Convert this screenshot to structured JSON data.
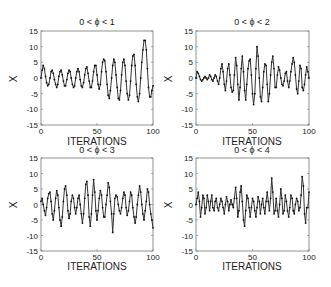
{
  "figure": {
    "panels": [
      {
        "title": "0 < ϕ < 1",
        "xlabel": "ITERATIONS",
        "ylabel": "X"
      },
      {
        "title": "0 < ϕ < 2",
        "xlabel": "ITERATIONS",
        "ylabel": "X"
      },
      {
        "title": "0 < ϕ < 3",
        "xlabel": "ITERATIONS",
        "ylabel": "X"
      },
      {
        "title": "0 < ϕ < 4",
        "xlabel": "ITERATIONS",
        "ylabel": "X"
      }
    ],
    "xticks": [
      "0",
      "50",
      "100"
    ],
    "yticks": [
      "15",
      "10",
      "5",
      "0",
      "-5",
      "-10",
      "-15"
    ],
    "line_color": "#333333"
  },
  "chart_data": [
    {
      "type": "line",
      "title": "0 < ϕ < 1",
      "xlabel": "ITERATIONS",
      "ylabel": "X",
      "xlim": [
        0,
        100
      ],
      "ylim": [
        -15,
        15
      ],
      "grid": false,
      "x_step": 1,
      "values": [
        0,
        2.5,
        4,
        3,
        0.5,
        -1.5,
        -2.5,
        -2,
        0,
        2,
        2.5,
        1.5,
        -0.5,
        -2,
        -3,
        -2,
        0.5,
        2,
        2.5,
        1,
        -1,
        -2.5,
        -2.5,
        -0.5,
        1.5,
        2.5,
        2,
        0,
        -2,
        -3,
        -2.5,
        0,
        2,
        3,
        2,
        -0.5,
        -2.5,
        -3,
        -1.5,
        1,
        3,
        3.5,
        1.5,
        -1,
        -3,
        -3,
        -1,
        2,
        4,
        4,
        1,
        -2,
        -3.5,
        -2,
        2,
        5,
        6,
        5.5,
        2,
        -2,
        -5.5,
        -6.5,
        -4,
        0,
        4,
        6,
        5,
        1,
        -3,
        -6.5,
        -7,
        -4,
        1,
        5,
        6,
        4,
        -1,
        -5,
        -7,
        -5.5,
        -1,
        4,
        7,
        7.5,
        4,
        -2,
        -6,
        -7.5,
        -5,
        0,
        5,
        9,
        12,
        12,
        9,
        3,
        -3,
        -6,
        -6,
        -4,
        -2.5
      ]
    },
    {
      "type": "line",
      "title": "0 < ϕ < 2",
      "xlabel": "ITERATIONS",
      "ylabel": "X",
      "xlim": [
        0,
        100
      ],
      "ylim": [
        -15,
        15
      ],
      "grid": false,
      "x_step": 1,
      "values": [
        0,
        2,
        1.5,
        0.5,
        -0.5,
        -1,
        -0.5,
        0,
        0.5,
        0,
        -0.5,
        0,
        1,
        0.5,
        -0.5,
        -1,
        0,
        1,
        0.5,
        -1,
        -2,
        0,
        3,
        4.5,
        2,
        -2,
        -4,
        -1,
        3,
        4.5,
        1,
        -3,
        -4.5,
        -4,
        1,
        6.5,
        4,
        -2,
        -7,
        -3,
        3,
        7,
        2,
        -4,
        -7,
        -2,
        3,
        5.5,
        6,
        1,
        -5,
        -8.5,
        -5,
        3,
        10,
        7,
        0,
        -6,
        -7.5,
        -3,
        2,
        4.5,
        4,
        -2,
        -7.5,
        -5,
        1,
        5,
        7,
        3,
        -3,
        -3,
        1,
        3.5,
        2.5,
        0,
        -2,
        -2.5,
        -1,
        1.5,
        2,
        -1,
        -3,
        -1,
        2,
        4.5,
        6.5,
        5,
        1,
        -3.5,
        -5,
        -1,
        4,
        3,
        -3,
        -4,
        -2,
        1,
        3.5,
        2,
        0
      ]
    },
    {
      "type": "line",
      "title": "0 < ϕ < 3",
      "xlabel": "ITERATIONS",
      "ylabel": "X",
      "xlim": [
        0,
        100
      ],
      "ylim": [
        -15,
        15
      ],
      "grid": false,
      "x_step": 1,
      "values": [
        1,
        2,
        0,
        -2,
        -3.5,
        -1,
        2,
        3.5,
        4,
        1,
        -3,
        -5,
        -2,
        2,
        4.5,
        3,
        -1,
        -5,
        -7,
        -4,
        1,
        5,
        6,
        3,
        -2,
        -4.5,
        -3,
        1,
        3,
        2,
        -1,
        -3,
        -1,
        2,
        3,
        0,
        -3,
        -6,
        -3,
        2,
        6.5,
        7.5,
        3,
        -4,
        -7,
        -3,
        3,
        8,
        4,
        -2,
        -5,
        -2,
        2,
        4.5,
        3,
        -1,
        -4,
        -4,
        0,
        3,
        7,
        5.5,
        1,
        -3,
        -9,
        -3,
        2,
        3,
        2.5,
        0,
        -2,
        -3,
        -1,
        2,
        4,
        3,
        -1,
        -3.5,
        -2,
        1,
        4,
        3,
        -1,
        -4,
        -6,
        -4,
        0,
        3,
        6,
        4,
        0,
        -3,
        -5,
        -2,
        1,
        5,
        4,
        0,
        -3,
        -5,
        -7.5
      ]
    },
    {
      "type": "line",
      "title": "0 < ϕ < 4",
      "xlabel": "ITERATIONS",
      "ylabel": "X",
      "xlim": [
        0,
        100
      ],
      "ylim": [
        -15,
        15
      ],
      "grid": false,
      "x_step": 1,
      "values": [
        0,
        2,
        4,
        1,
        -4,
        -1,
        3,
        2,
        -3,
        -1,
        3,
        1,
        -2,
        1,
        3,
        -1,
        -2,
        1,
        2,
        -1,
        -2,
        0,
        2,
        1,
        -1,
        -3,
        0,
        2.5,
        1,
        -2,
        0,
        1.5,
        0,
        -1,
        2,
        5.5,
        2,
        -4,
        -2,
        4,
        6,
        1,
        -5,
        -7,
        -2,
        3,
        2,
        -1,
        -4,
        -1,
        2,
        1,
        -2,
        -4,
        -1,
        2.5,
        1,
        -3,
        0,
        2,
        -1,
        -3,
        1,
        4,
        1,
        -2,
        2,
        8.5,
        4,
        -3,
        -2,
        2,
        -2,
        -4,
        0,
        5,
        2,
        -3,
        -2,
        3,
        1,
        -2,
        -4,
        -1,
        3,
        2,
        -2,
        -3,
        0,
        2,
        1,
        -2,
        -1,
        3,
        9,
        6,
        -3,
        -6,
        -1,
        -1,
        4
      ]
    }
  ]
}
